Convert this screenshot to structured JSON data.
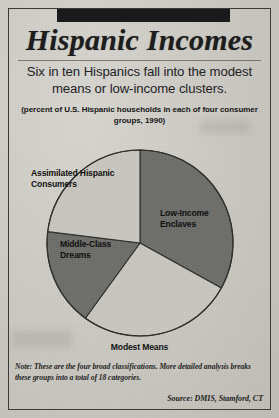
{
  "figure": {
    "title": "Hispanic Incomes",
    "deck": "Six in ten Hispanics fall into the modest means or low-income clusters.",
    "paren_note": "(percent of U.S. Hispanic households in each of four consumer groups, 1990)",
    "footnote": "Note: These are the four broad classifications. More detailed analysis breaks these groups into a total of 18 categories.",
    "source": "Source: DMIS, Stamford, CT"
  },
  "chart_data": {
    "type": "pie",
    "title": "Hispanic Incomes",
    "subtitle": "Six in ten Hispanics fall into the modest means or low-income clusters.",
    "units": "percent of U.S. Hispanic households",
    "year": "1990",
    "legend": "labels placed on slices",
    "categories": [
      "Low-Income Enclaves",
      "Modest Means",
      "Middle-Class Dreams",
      "Assimilated Hispanic Consumers"
    ],
    "values": [
      33,
      27,
      17,
      23
    ],
    "slices": [
      {
        "label": "Low-Income Enclaves",
        "label_line1": "Low-Income",
        "label_line2": "Enclaves",
        "value": 33,
        "start_angle": 0,
        "end_angle": 119,
        "color": "#6e6e6b"
      },
      {
        "label": "Modest Means",
        "label_line1": "Modest Means",
        "label_line2": "",
        "value": 27,
        "start_angle": 119,
        "end_angle": 216,
        "color": "#c9c7c0"
      },
      {
        "label": "Middle-Class Dreams",
        "label_line1": "Middle-Class",
        "label_line2": "Dreams",
        "value": 17,
        "start_angle": 216,
        "end_angle": 277,
        "color": "#6e6e6b"
      },
      {
        "label": "Assimilated Hispanic Consumers",
        "label_line1": "Assimilated Hispanic",
        "label_line2": "Consumers",
        "value": 23,
        "start_angle": 277,
        "end_angle": 360,
        "color": "#c9c7c0"
      }
    ],
    "colors": {
      "dark_slice": "#6e6e6b",
      "light_slice": "#c9c7c0",
      "outline": "#2e2e2c"
    },
    "grid": false
  }
}
